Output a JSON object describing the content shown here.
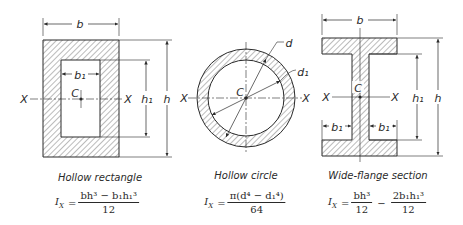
{
  "figure": {
    "colors": {
      "line": "#2a2a2a",
      "hatch": "#555555",
      "background": "#ffffff"
    },
    "sections": [
      {
        "id": "hollow-rectangle",
        "caption": "Hollow rectangle",
        "labels": {
          "width": "b",
          "inner_width": "b₁",
          "height": "h",
          "inner_height": "h₁",
          "centroid": "C",
          "axis_left": "X",
          "axis_right": "X"
        },
        "formula": {
          "lhs": "I",
          "lhs_sub": "X",
          "eq": "=",
          "numerator": "bh³ − b₁h₁³",
          "denominator": "12"
        }
      },
      {
        "id": "hollow-circle",
        "caption": "Hollow circle",
        "labels": {
          "outer_diameter": "d",
          "inner_diameter": "d₁",
          "centroid": "C",
          "axis_left": "X",
          "axis_right": "X"
        },
        "formula": {
          "lhs": "I",
          "lhs_sub": "X",
          "eq": "=",
          "numerator": "π(d⁴ − d₁⁴)",
          "denominator": "64"
        }
      },
      {
        "id": "wide-flange-section",
        "caption": "Wide-flange section",
        "labels": {
          "width": "b",
          "flange_overhang_left": "b₁",
          "flange_overhang_right": "b₁",
          "height": "h",
          "inner_height": "h₁",
          "centroid": "C",
          "axis_left": "X",
          "axis_right": "X"
        },
        "formula": {
          "lhs": "I",
          "lhs_sub": "X",
          "eq": "=",
          "term1_num": "bh³",
          "term1_den": "12",
          "op": "−",
          "term2_num": "2b₁h₁³",
          "term2_den": "12"
        }
      }
    ]
  }
}
